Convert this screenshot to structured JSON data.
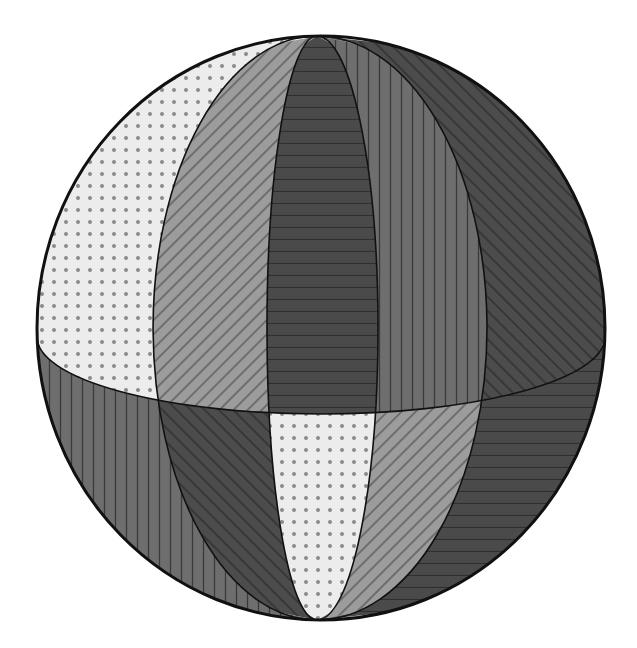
{
  "figure": {
    "title": "Sphere divided into ten patterned regions by four meridians and an equator",
    "outline": {
      "cx": 321,
      "cy": 328,
      "rx": 284,
      "ry": 292,
      "stroke": "#111111",
      "stroke_width": 3
    },
    "poles": {
      "top": [
        316,
        36
      ],
      "bottom": [
        318,
        620
      ]
    },
    "equator": {
      "cx": 321,
      "cy": 337,
      "rx": 284,
      "ry": 77
    },
    "meridians": [
      {
        "name": "meridian-1",
        "side": "left",
        "rx": 164
      },
      {
        "name": "meridian-2",
        "side": "left",
        "rx": 50
      },
      {
        "name": "meridian-3",
        "side": "right",
        "rx": 61
      },
      {
        "name": "meridian-4",
        "side": "right",
        "rx": 170
      }
    ],
    "patterns": {
      "dots": {
        "background": "#ececec",
        "ink": "#8a8a8a",
        "spacing": 12
      },
      "back_diagonal": {
        "background": "#9c9c9c",
        "ink": "#555555",
        "spacing": 10
      },
      "horizontal": {
        "background": "#4a4a4a",
        "ink": "#2f2f2f",
        "spacing": 12
      },
      "vertical": {
        "background": "#6e6e6e",
        "ink": "#3a3a3a",
        "spacing": 11
      },
      "forward_diagonal": {
        "background": "#4c4c4c",
        "ink": "#2c2c2c",
        "spacing": 10
      }
    },
    "regions": {
      "upper": [
        "dots",
        "back_diagonal",
        "horizontal",
        "vertical",
        "forward_diagonal"
      ],
      "lower": [
        "vertical",
        "forward_diagonal",
        "dots",
        "back_diagonal",
        "horizontal"
      ]
    }
  }
}
